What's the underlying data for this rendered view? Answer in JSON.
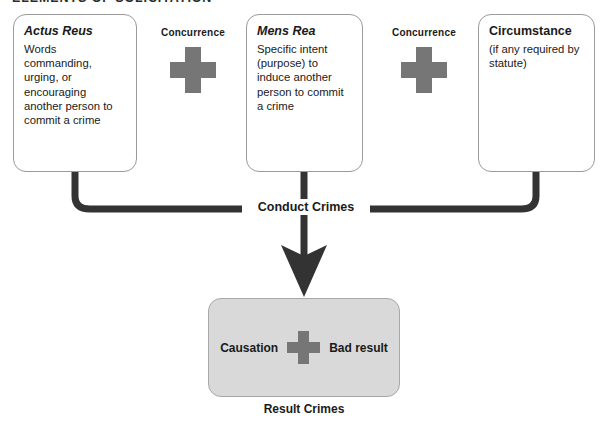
{
  "page": {
    "title": "ELEMENTS OF SOLICITATION"
  },
  "elements": [
    {
      "id": "actus-reus",
      "title": "Actus Reus",
      "body": "Words commanding, urging, or encouraging another person to commit a crime",
      "italic": true
    },
    {
      "id": "mens-rea",
      "title": "Mens Rea",
      "body": "Specific intent (purpose) to induce another person to commit a crime",
      "italic": true
    },
    {
      "id": "circumstance",
      "title": "Circumstance",
      "body": "(if any required by statute)",
      "italic": false
    }
  ],
  "connectors": [
    {
      "id": "concurrence-1",
      "label": "Concurrence",
      "symbol": "plus-icon"
    },
    {
      "id": "concurrence-2",
      "label": "Concurrence",
      "symbol": "plus-icon"
    }
  ],
  "flow": {
    "conduct_label": "Conduct Crimes",
    "arrow": "down-arrow-icon"
  },
  "result": {
    "left_term": "Causation",
    "operator": "plus-icon",
    "right_term": "Bad result",
    "caption": "Result Crimes"
  },
  "colors": {
    "plus_gray": "#767676",
    "result_box_fill": "#d9d9d9",
    "result_box_border": "#a8a8a8",
    "box_border": "#9a9a9a",
    "line_dark": "#333333",
    "text": "#1a1a1a",
    "background": "#ffffff"
  }
}
